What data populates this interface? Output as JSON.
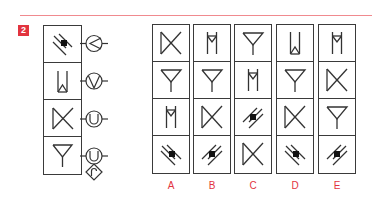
{
  "question": {
    "number": "2",
    "accent_color": "#e2343f",
    "rule_color": "#f08a8f"
  },
  "stack": {
    "cells": [
      {
        "symbol": "diagonal-square-icon",
        "variant": "backslash"
      },
      {
        "symbol": "trap-up-icon"
      },
      {
        "symbol": "bowtie-icon"
      },
      {
        "symbol": "funnel-icon"
      }
    ],
    "connectors": [
      {
        "symbol": "circle-chevron-left-icon"
      },
      {
        "symbol": "circle-chevron-down-icon"
      },
      {
        "symbol": "circle-u-icon"
      },
      {
        "symbol": "circle-u-icon"
      },
      {
        "symbol": "diamond-hook-icon"
      }
    ]
  },
  "options": [
    {
      "label": "A",
      "cells": [
        "bowtie-icon",
        "funnel-icon",
        "trap-down-icon",
        "diagonal-square-backslash-icon"
      ]
    },
    {
      "label": "B",
      "cells": [
        "trap-down-icon",
        "funnel-icon",
        "bowtie-icon",
        "diagonal-square-slash-icon"
      ]
    },
    {
      "label": "C",
      "cells": [
        "funnel-icon",
        "trap-down-icon",
        "diagonal-square-slash-icon",
        "bowtie-icon"
      ]
    },
    {
      "label": "D",
      "cells": [
        "trap-up-icon",
        "funnel-icon",
        "bowtie-icon",
        "diagonal-square-backslash-icon"
      ]
    },
    {
      "label": "E",
      "cells": [
        "trap-down-icon",
        "bowtie-icon",
        "funnel-icon",
        "diagonal-square-slash-icon"
      ]
    }
  ]
}
